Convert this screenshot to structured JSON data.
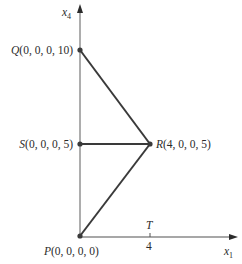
{
  "diagram": {
    "axes": {
      "vertical": {
        "label": "x",
        "subscript": "4"
      },
      "horizontal": {
        "label": "x",
        "subscript": "1"
      }
    },
    "tick": {
      "label_above": "T",
      "label_below": "4",
      "value": 4
    },
    "points": [
      {
        "id": "Q",
        "name": "Q",
        "coords": "(0, 0, 0, 10)",
        "x1": 0,
        "x4": 10
      },
      {
        "id": "S",
        "name": "S",
        "coords": "(0, 0, 0, 5)",
        "x1": 0,
        "x4": 5
      },
      {
        "id": "R",
        "name": "R",
        "coords": "(4, 0, 0, 5)",
        "x1": 4,
        "x4": 5
      },
      {
        "id": "P",
        "name": "P",
        "coords": "(0, 0, 0, 0)",
        "x1": 0,
        "x4": 0
      }
    ],
    "edges": [
      [
        "Q",
        "R"
      ],
      [
        "S",
        "R"
      ],
      [
        "P",
        "R"
      ]
    ]
  }
}
